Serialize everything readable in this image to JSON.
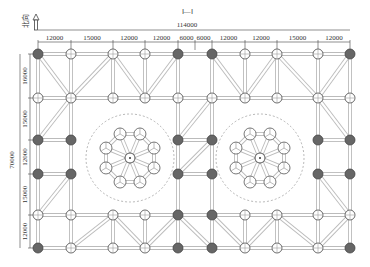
{
  "section_label": "Ⅰ—Ⅰ",
  "north_label": "北向",
  "total_width": "114000",
  "total_height": "70000",
  "top_dims": [
    "12000",
    "15000",
    "12000",
    "12000",
    "6000",
    "6000",
    "12000",
    "12000",
    "15000",
    "12000"
  ],
  "left_dims": [
    "16000",
    "15000",
    "12000",
    "15000",
    "12000"
  ],
  "grid": {
    "cols": [
      38,
      71,
      113,
      145,
      178,
      212,
      245,
      277,
      318,
      350
    ],
    "rows": [
      54,
      98,
      140,
      174,
      215,
      248
    ]
  },
  "domes": [
    {
      "name": "dome-left",
      "cx": 130,
      "cy": 158,
      "r": 26,
      "outer_r": 44
    },
    {
      "name": "dome-right",
      "cx": 260,
      "cy": 158,
      "r": 26,
      "outer_r": 44
    }
  ],
  "colors": {
    "line": "#999",
    "node_fill": "#fff",
    "node_dark": "#555",
    "dash": "#888"
  }
}
